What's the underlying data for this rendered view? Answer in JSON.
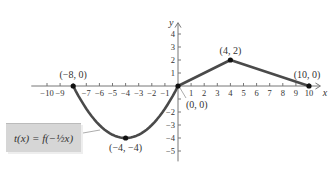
{
  "chart_data": {
    "type": "line",
    "title": "",
    "xlabel": "x",
    "ylabel": "y",
    "xlim": [
      -10,
      10
    ],
    "ylim": [
      -5,
      4
    ],
    "x_ticks": [
      -10,
      -9,
      -8,
      -7,
      -6,
      -5,
      -4,
      -3,
      -2,
      -1,
      1,
      2,
      3,
      4,
      5,
      6,
      7,
      8,
      9,
      10
    ],
    "y_ticks": [
      -5,
      -4,
      -3,
      -2,
      -1,
      1,
      2,
      3,
      4
    ],
    "x_tick_labels": [
      "-10",
      "-9",
      "-7",
      "-6",
      "-5",
      "-4",
      "-3",
      "-2",
      "-1",
      "1",
      "2",
      "3",
      "4",
      "5",
      "6",
      "7",
      "8",
      "9",
      "10"
    ],
    "y_tick_labels": [
      "4",
      "3",
      "2",
      "1",
      "-2",
      "-3",
      "-4",
      "-5"
    ],
    "series": [
      {
        "name": "t(x) = f(-1/2 x)",
        "segments": [
          {
            "shape": "parabola",
            "points": [
              [
                -8,
                0
              ],
              [
                -4,
                -4
              ],
              [
                0,
                0
              ]
            ]
          },
          {
            "shape": "line",
            "points": [
              [
                0,
                0
              ],
              [
                4,
                2
              ],
              [
                10,
                0
              ]
            ]
          }
        ]
      }
    ],
    "annotations": [
      {
        "text": "(-8, 0)",
        "x": -8,
        "y": 0
      },
      {
        "text": "(-4, -4)",
        "x": -4,
        "y": -4
      },
      {
        "text": "(0, 0)",
        "x": 0,
        "y": 0
      },
      {
        "text": "(4, 2)",
        "x": 4,
        "y": 2
      },
      {
        "text": "(10, 0)",
        "x": 10,
        "y": 0
      }
    ],
    "legend": {
      "text": "t(x) = f(−½x)",
      "position": "lower-left"
    },
    "grid": false
  },
  "labels": {
    "x_axis": "x",
    "y_axis": "y",
    "legend": "t(x) = f(−½x)",
    "p1": "(−8, 0)",
    "p2": "(−4, −4)",
    "p3": "(0, 0)",
    "p4": "(4, 2)",
    "p5": "(10, 0)"
  }
}
